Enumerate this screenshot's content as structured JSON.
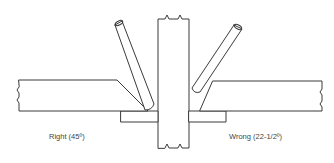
{
  "diagram": {
    "type": "welding-joint-comparison",
    "colors": {
      "line": "#3a3a3a",
      "text": "#444444",
      "background": "#ffffff"
    },
    "left": {
      "label": "Right (45º)",
      "bevel_angle_deg": 45
    },
    "right": {
      "label": "Wrong (22-1/2º)",
      "bevel_angle_deg": 22.5
    },
    "components": [
      "center-plate",
      "left-plate",
      "right-plate",
      "left-backing-bar",
      "right-backing-bar",
      "left-electrode",
      "right-electrode"
    ]
  }
}
